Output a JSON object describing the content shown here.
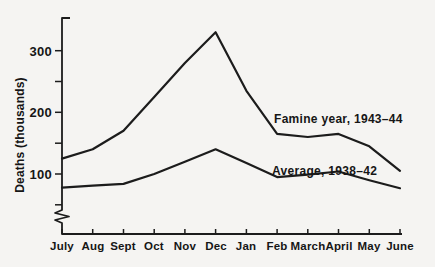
{
  "colors": {
    "background": "#f5f4f2",
    "ink": "#1c1c1c",
    "text": "#161616"
  },
  "chart_data": {
    "type": "line",
    "title": "",
    "xlabel": "",
    "ylabel": "Deaths (thousands)",
    "categories": [
      "July",
      "Aug",
      "Sept",
      "Oct",
      "Nov",
      "Dec",
      "Jan",
      "Feb",
      "March",
      "April",
      "May",
      "June"
    ],
    "series": [
      {
        "name": "Famine year, 1943–44",
        "values": [
          125,
          140,
          170,
          225,
          280,
          330,
          235,
          165,
          160,
          165,
          145,
          105
        ]
      },
      {
        "name": "Average, 1938–42",
        "values": [
          78,
          81,
          84,
          100,
          120,
          140,
          118,
          95,
          99,
          104,
          90,
          77
        ]
      }
    ],
    "y_axis": {
      "ticks": [
        50,
        100,
        150,
        200,
        250,
        300
      ],
      "labeled_ticks": [
        300,
        200,
        100
      ],
      "ylim": [
        0,
        350
      ],
      "axis_break": true
    },
    "grid": false,
    "legend_position": "inline-annotations-next-to-lines"
  }
}
